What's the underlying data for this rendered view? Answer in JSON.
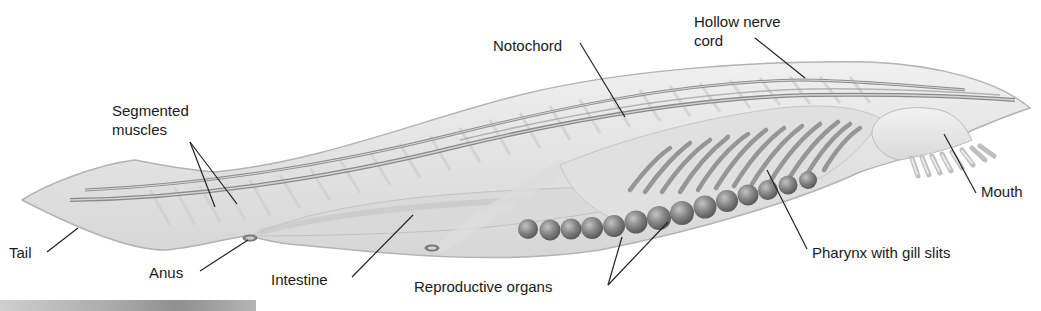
{
  "figure": {
    "colors": {
      "body_fill": "#e6e6e6",
      "body_stroke": "#b8b8b8",
      "structure": "#8c8c8c",
      "organ": "#7d7d7d",
      "leader_line": "#222222",
      "label_text": "#1a1a1a",
      "background": "#ffffff"
    }
  },
  "labels": {
    "notochord": "Notochord",
    "hollow_nerve_cord": [
      "Hollow nerve",
      "cord"
    ],
    "segmented_muscles": [
      "Segmented",
      "muscles"
    ],
    "tail": "Tail",
    "anus": "Anus",
    "intestine": "Intestine",
    "reproductive_organs": "Reproductive organs",
    "pharynx": "Pharynx with gill slits",
    "mouth": "Mouth"
  }
}
